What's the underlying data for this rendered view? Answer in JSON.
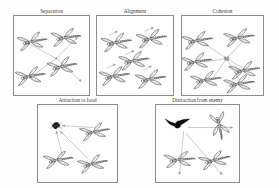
{
  "figure": {
    "background_color": "#fdfdfd",
    "border_color": "#8d8d8d",
    "stroke_color": "#4a4a4a",
    "arrow_color": "#9a9a9a",
    "enemy_color": "#0d0d0d"
  },
  "panels": [
    {
      "id": "separation",
      "title": "Separation",
      "x": 13,
      "y": 8,
      "width": 77,
      "height": 88,
      "agent_count": 4,
      "icon": "dragonfly-icon",
      "arrow_pattern": "outward-diverging",
      "has_center_node": true,
      "center_node": [
        44,
        44
      ],
      "agents": [
        {
          "cx": 21,
          "cy": 26,
          "angle": -12,
          "scale": 1.0
        },
        {
          "cx": 56,
          "cy": 22,
          "angle": -10,
          "scale": 1.0
        },
        {
          "cx": 52,
          "cy": 52,
          "angle": -14,
          "scale": 1.0
        },
        {
          "cx": 19,
          "cy": 62,
          "angle": -12,
          "scale": 1.0
        }
      ],
      "arrows": [
        {
          "x1": 44,
          "y1": 44,
          "x2": 14,
          "y2": 28
        },
        {
          "x1": 44,
          "y1": 44,
          "x2": 66,
          "y2": 22
        },
        {
          "x1": 44,
          "y1": 44,
          "x2": 70,
          "y2": 68
        },
        {
          "x1": 44,
          "y1": 44,
          "x2": 16,
          "y2": 64
        }
      ]
    },
    {
      "id": "alignment",
      "title": "Alignment",
      "x": 96,
      "y": 8,
      "width": 78,
      "height": 88,
      "agent_count": 5,
      "icon": "dragonfly-icon",
      "arrow_pattern": "parallel-same-direction",
      "has_center_node": false,
      "agents": [
        {
          "cx": 22,
          "cy": 27,
          "angle": -12,
          "scale": 1.0
        },
        {
          "cx": 58,
          "cy": 23,
          "angle": -12,
          "scale": 1.0
        },
        {
          "cx": 40,
          "cy": 46,
          "angle": -12,
          "scale": 1.0
        },
        {
          "cx": 20,
          "cy": 62,
          "angle": -12,
          "scale": 1.0
        },
        {
          "cx": 57,
          "cy": 65,
          "angle": -12,
          "scale": 1.0
        }
      ],
      "arrows": [
        {
          "x1": 12,
          "y1": 20,
          "x2": 21,
          "y2": 16
        },
        {
          "x1": 49,
          "y1": 16,
          "x2": 58,
          "y2": 12
        },
        {
          "x1": 29,
          "y1": 40,
          "x2": 38,
          "y2": 36
        },
        {
          "x1": 10,
          "y1": 54,
          "x2": 19,
          "y2": 50
        },
        {
          "x1": 47,
          "y1": 56,
          "x2": 56,
          "y2": 52
        }
      ]
    },
    {
      "id": "cohesion",
      "title": "Cohesion",
      "x": 181,
      "y": 8,
      "width": 83,
      "height": 88,
      "agent_count": 6,
      "icon": "dragonfly-icon",
      "arrow_pattern": "inward-converging",
      "has_center_node": true,
      "center_node": [
        43,
        44
      ],
      "agents": [
        {
          "cx": 17,
          "cy": 25,
          "angle": -12,
          "scale": 0.95
        },
        {
          "cx": 57,
          "cy": 22,
          "angle": -12,
          "scale": 0.95
        },
        {
          "cx": 16,
          "cy": 47,
          "angle": -12,
          "scale": 0.95
        },
        {
          "cx": 62,
          "cy": 56,
          "angle": -12,
          "scale": 0.95
        },
        {
          "cx": 25,
          "cy": 66,
          "angle": -12,
          "scale": 0.95
        },
        {
          "cx": 57,
          "cy": 70,
          "angle": -12,
          "scale": 0.95
        }
      ],
      "arrows": [
        {
          "x1": 22,
          "y1": 29,
          "x2": 43,
          "y2": 44
        },
        {
          "x1": 58,
          "y1": 27,
          "x2": 43,
          "y2": 44
        },
        {
          "x1": 21,
          "y1": 48,
          "x2": 43,
          "y2": 44
        },
        {
          "x1": 60,
          "y1": 55,
          "x2": 43,
          "y2": 44
        },
        {
          "x1": 30,
          "y1": 64,
          "x2": 43,
          "y2": 44
        },
        {
          "x1": 55,
          "y1": 66,
          "x2": 43,
          "y2": 44
        }
      ]
    },
    {
      "id": "attraction-to-food",
      "title": "Attraction to food",
      "x": 37,
      "y": 97,
      "width": 81,
      "height": 86,
      "agent_count": 3,
      "icon": "dragonfly-icon",
      "target_icon": "food-icon",
      "target_position": [
        18,
        22
      ],
      "arrow_pattern": "toward-food",
      "has_center_node": false,
      "agents": [
        {
          "cx": 58,
          "cy": 28,
          "angle": -14,
          "scale": 0.95
        },
        {
          "cx": 22,
          "cy": 58,
          "angle": -12,
          "scale": 0.95
        },
        {
          "cx": 56,
          "cy": 62,
          "angle": -16,
          "scale": 0.95
        }
      ],
      "arrows": [
        {
          "x1": 55,
          "y1": 24,
          "x2": 24,
          "y2": 22
        },
        {
          "x1": 24,
          "y1": 54,
          "x2": 18,
          "y2": 28
        },
        {
          "x1": 50,
          "y1": 58,
          "x2": 22,
          "y2": 28
        }
      ]
    },
    {
      "id": "distraction-from-enemy",
      "title": "Distraction from enemy",
      "x": 155,
      "y": 97,
      "width": 85,
      "height": 86,
      "agent_count": 3,
      "icon": "dragonfly-icon",
      "target_icon": "enemy-bird-icon",
      "target_position": [
        20,
        20
      ],
      "arrow_pattern": "away-from-enemy",
      "has_center_node": false,
      "agents": [
        {
          "cx": 60,
          "cy": 24,
          "angle": 78,
          "scale": 0.95
        },
        {
          "cx": 24,
          "cy": 58,
          "angle": -8,
          "scale": 0.95
        },
        {
          "cx": 57,
          "cy": 58,
          "angle": -18,
          "scale": 0.95
        }
      ],
      "arrows": [
        {
          "x1": 30,
          "y1": 24,
          "x2": 72,
          "y2": 24
        },
        {
          "x1": 26,
          "y1": 28,
          "x2": 22,
          "y2": 74
        },
        {
          "x1": 28,
          "y1": 30,
          "x2": 62,
          "y2": 74
        }
      ]
    }
  ]
}
